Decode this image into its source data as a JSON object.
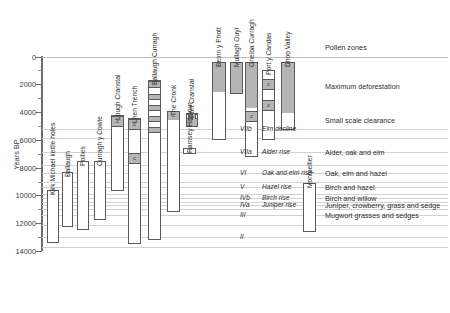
{
  "chart_data": {
    "type": "bar",
    "orientation": "vertical-ranges",
    "title": "",
    "xlabel": "",
    "ylabel": "Years BP",
    "ylim": [
      0,
      14000
    ],
    "y_inverted": true,
    "y_ticks_major": [
      0,
      2000,
      4000,
      6000,
      8000,
      10000,
      12000,
      14000
    ],
    "y_ticks_minor": [
      1000,
      3000,
      5000,
      7000,
      9000,
      11000,
      13000
    ],
    "grid": true,
    "legend_position": "none",
    "categories": [
      "Kirk Michael kettle holes",
      "Ballaugh",
      "Poilies",
      "Curragh y Cowle",
      "Lough Cranstal",
      "Lhen Trench",
      "Ballaugh Curragh",
      "The Cronk",
      "Ramsey Harbour",
      "Port Cranstal",
      "Beinn y Phott",
      "Mullagh Ouyr",
      "Gneiba Curragh",
      "Port y Candas",
      "Dhoo Valley",
      "Montpellier"
    ],
    "series": [
      {
        "name": "Kirk Michael kettle holes",
        "start_bp": 9600,
        "end_bp": 13400,
        "clearance_markers": []
      },
      {
        "name": "Ballaugh",
        "start_bp": 8300,
        "end_bp": 12300,
        "clearance_markers": []
      },
      {
        "name": "Poilies",
        "start_bp": 7500,
        "end_bp": 12500,
        "clearance_markers": []
      },
      {
        "name": "Curragh y Cowle",
        "start_bp": 7500,
        "end_bp": 11800,
        "clearance_markers": []
      },
      {
        "name": "Lough Cranstal",
        "start_bp": 4200,
        "end_bp": 9700,
        "clearance_markers": [
          4500
        ]
      },
      {
        "name": "Lhen Trench",
        "start_bp": 4400,
        "end_bp": 13500,
        "clearance_markers": [
          4700,
          7200
        ]
      },
      {
        "name": "Ballaugh Curragh",
        "start_bp": 1700,
        "end_bp": 13200,
        "clearance_markers": []
      },
      {
        "name": "The Cronk",
        "start_bp": 3900,
        "end_bp": 11200,
        "clearance_markers": []
      },
      {
        "name": "Ramsey Harbour",
        "start_bp": 6600,
        "end_bp": 7000,
        "clearance_markers": []
      },
      {
        "name": "Port Cranstal",
        "start_bp": 4100,
        "end_bp": 5100,
        "clearance_markers": []
      },
      {
        "name": "Beinn y Phott",
        "start_bp": 400,
        "end_bp": 6000,
        "clearance_markers": [
          700,
          1900
        ]
      },
      {
        "name": "Mullagh Ouyr",
        "start_bp": 400,
        "end_bp": 2700,
        "clearance_markers": []
      },
      {
        "name": "Gneiba Curragh",
        "start_bp": 400,
        "end_bp": 7200,
        "clearance_markers": [
          700,
          1200,
          4200
        ]
      },
      {
        "name": "Port y Candas",
        "start_bp": 1000,
        "end_bp": 6000,
        "clearance_markers": [
          1900,
          3400
        ]
      },
      {
        "name": "Dhoo Valley",
        "start_bp": 400,
        "end_bp": 5300,
        "clearance_markers": [
          700,
          1500
        ]
      },
      {
        "name": "Montpellier",
        "start_bp": 9100,
        "end_bp": 12600,
        "clearance_markers": []
      }
    ],
    "phase_annotations": [
      {
        "label": "Maximum deforestation",
        "bp": 2100
      },
      {
        "label": "Small scale clearance",
        "bp": 4600
      }
    ],
    "pollen_zones": [
      {
        "code": "VIIb",
        "name": "Elm decline",
        "description": "",
        "bp": 5200
      },
      {
        "code": "VIIa",
        "name": "Alder rise",
        "description": "Alder, oak and elm",
        "bp": 6900
      },
      {
        "code": "VI",
        "name": "Oak and elm rise",
        "description": "Oak, elm and hazel",
        "bp": 8400
      },
      {
        "code": "V",
        "name": "Hazel rise",
        "description": "Birch and hazel",
        "bp": 9400
      },
      {
        "code": "IVb",
        "name": "Birch rise",
        "description": "Birch and willow",
        "bp": 10200
      },
      {
        "code": "IVa",
        "name": "Juniper rise",
        "description": "Juniper, crowberry, grass and sedge",
        "bp": 10700
      },
      {
        "code": "III",
        "name": "",
        "description": "Mugwort grasses and sedges",
        "bp": 11400
      },
      {
        "code": "II",
        "name": "",
        "description": "",
        "bp": 13000
      }
    ],
    "pollen_zones_header": "Pollen zones",
    "clearance_marker_symbol": "c",
    "colors": {
      "bar_fill": "#ffffff",
      "bar_stroke": "#5a5a5a",
      "segment_fill": "#b5b5b5",
      "grid": "#d2d2d2",
      "text": "#2e2e2e",
      "axis": "#6d6d6d"
    }
  }
}
